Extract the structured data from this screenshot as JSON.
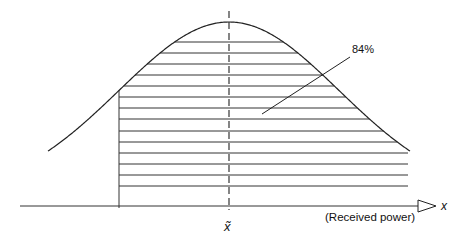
{
  "figure": {
    "type": "normal-distribution-cdf-illustration",
    "percent_label": "84%",
    "axis_label": "x",
    "axis_caption": "(Received power)",
    "median_label": "x̃",
    "hatched_region": "from one standard deviation below the median to +infinity",
    "hatch_line_count": 15
  },
  "geometry": {
    "axis_y": 206,
    "axis_x_start": 20,
    "axis_x_end": 418,
    "peak": {
      "x": 229,
      "y": 22
    },
    "sigma_px": 110,
    "lower_bound_x": 119,
    "curve_x_start": 48,
    "curve_x_end": 410,
    "hatch_ys": [
      42,
      53,
      64,
      75,
      86,
      97,
      108,
      119,
      131,
      142,
      153,
      164,
      175,
      186,
      197
    ],
    "leader": {
      "x1": 350,
      "y1": 57,
      "x2": 262,
      "y2": 114
    }
  },
  "colors": {
    "stroke": "#222222",
    "background": "#ffffff"
  }
}
